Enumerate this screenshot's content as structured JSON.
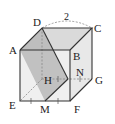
{
  "diagram": {
    "type": "cube-cross-section",
    "vertices": {
      "A": {
        "label": "A",
        "x": 20,
        "y": 50
      },
      "B": {
        "label": "B",
        "x": 70,
        "y": 50
      },
      "C": {
        "label": "C",
        "x": 92,
        "y": 28
      },
      "D": {
        "label": "D",
        "x": 42,
        "y": 28
      },
      "E": {
        "label": "E",
        "x": 20,
        "y": 101
      },
      "F": {
        "label": "F",
        "x": 70,
        "y": 101
      },
      "G": {
        "label": "G",
        "x": 92,
        "y": 79
      },
      "H": {
        "label": "H",
        "x": 42,
        "y": 79
      },
      "M": {
        "label": "M",
        "x": 45,
        "y": 101
      },
      "N": {
        "label": "N",
        "x": 68,
        "y": 79
      }
    },
    "edge_length_label": "2",
    "colors": {
      "edge": "#333333",
      "hidden_edge": "#888888",
      "section_fill": "#b8b8b8",
      "top_face_fill": "#d9d9d9",
      "right_face_fill": "#e6e6e6",
      "front_face_fill": "#ececec"
    }
  }
}
